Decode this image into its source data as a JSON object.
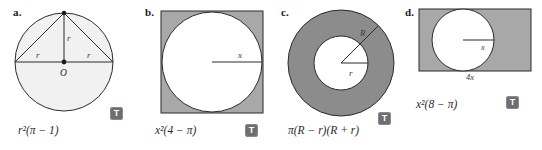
{
  "figure": {
    "type": "geometry-figure-set",
    "background": "#ffffff",
    "shade_light": "#f0f0f0",
    "shade_mid": "#a8a8a8",
    "shade_dark": "#8c8c8c",
    "stroke": "#2b2b2b"
  },
  "panels": [
    {
      "id": "a",
      "letter": "a.",
      "shape": "circle-with-inscribed-triangles",
      "formula": "r²(π − 1)",
      "formula_plain": "r^2(pi - 1)",
      "labels": {
        "radius_vertical": "r",
        "radius_left": "r",
        "radius_right": "r",
        "center": "O"
      },
      "badge": "T"
    },
    {
      "id": "b",
      "letter": "b.",
      "shape": "square-with-inscribed-circle",
      "formula": "x²(4 − π)",
      "formula_plain": "x^2(4 - pi)",
      "labels": {
        "radius": "x"
      },
      "badge": "T"
    },
    {
      "id": "c",
      "letter": "c.",
      "shape": "annulus",
      "formula": "π(R − r)(R + r)",
      "formula_plain": "pi(R - r)(R + r)",
      "labels": {
        "outer_radius": "R",
        "inner_radius": "r"
      },
      "badge": "T"
    },
    {
      "id": "d",
      "letter": "d.",
      "shape": "rectangle-with-inscribed-circle",
      "formula": "x²(8 − π)",
      "formula_plain": "x^2(8 - pi)",
      "labels": {
        "radius": "x",
        "base": "4x"
      },
      "badge": "T"
    }
  ]
}
